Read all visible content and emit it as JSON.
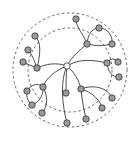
{
  "diagram": {
    "type": "radial-tree",
    "colors": {
      "node_fill": "#9a9a9a",
      "root_fill": "#ffffff",
      "stroke": "#333333",
      "ring": "#555555",
      "background": "#ffffff"
    },
    "rings": [
      {
        "id": "outer",
        "cx": 70,
        "cy": 70,
        "r": 57
      },
      {
        "id": "inner",
        "cx": 70,
        "cy": 70,
        "r": 42
      }
    ],
    "root": {
      "id": "root",
      "x": 67,
      "y": 66,
      "r": 3.2
    },
    "nodes": [
      {
        "id": "n1",
        "x": 76,
        "y": 19
      },
      {
        "id": "n2",
        "x": 99,
        "y": 28
      },
      {
        "id": "n3",
        "x": 87,
        "y": 44
      },
      {
        "id": "n4",
        "x": 112,
        "y": 44
      },
      {
        "id": "n5",
        "x": 35,
        "y": 36
      },
      {
        "id": "n6",
        "x": 28,
        "y": 50
      },
      {
        "id": "n7",
        "x": 23,
        "y": 62
      },
      {
        "id": "n8",
        "x": 37,
        "y": 68
      },
      {
        "id": "n9",
        "x": 107,
        "y": 63
      },
      {
        "id": "n10",
        "x": 118,
        "y": 62
      },
      {
        "id": "n11",
        "x": 119,
        "y": 77
      },
      {
        "id": "n12",
        "x": 43,
        "y": 87
      },
      {
        "id": "n13",
        "x": 27,
        "y": 91
      },
      {
        "id": "n14",
        "x": 32,
        "y": 105
      },
      {
        "id": "n15",
        "x": 42,
        "y": 113
      },
      {
        "id": "n16",
        "x": 66,
        "y": 93
      },
      {
        "id": "n17",
        "x": 81,
        "y": 89
      },
      {
        "id": "n18",
        "x": 112,
        "y": 98
      },
      {
        "id": "n19",
        "x": 102,
        "y": 108
      },
      {
        "id": "n20",
        "x": 86,
        "y": 119
      },
      {
        "id": "n21",
        "x": 67,
        "y": 123
      }
    ],
    "edges": [
      {
        "from": "root",
        "to": "n3",
        "d": "M67,66 C72,56 80,50 87,44"
      },
      {
        "from": "n3",
        "to": "n1",
        "d": "M87,44 C84,34 76,28 76,19"
      },
      {
        "from": "n3",
        "to": "n2",
        "d": "M87,44 C88,34 92,28 99,28"
      },
      {
        "from": "n3",
        "to": "n4",
        "d": "M87,44 C95,46 104,46 112,44"
      },
      {
        "from": "n2",
        "to": "n4",
        "d": "M99,28 C108,28 113,36 112,44"
      },
      {
        "from": "root",
        "to": "n8",
        "d": "M67,66 C56,62 46,64 37,68"
      },
      {
        "from": "n8",
        "to": "n5",
        "d": "M37,68 C40,56 42,42 35,36"
      },
      {
        "from": "n8",
        "to": "n6",
        "d": "M37,68 C34,60 32,54 28,50"
      },
      {
        "from": "n8",
        "to": "n7",
        "d": "M37,68 C32,66 27,64 23,62"
      },
      {
        "from": "root",
        "to": "n9",
        "d": "M67,66 C80,58 94,60 107,63"
      },
      {
        "from": "n9",
        "to": "n10",
        "d": "M107,63 C110,58 115,58 118,62"
      },
      {
        "from": "n9",
        "to": "n11",
        "d": "M107,63 C108,72 112,77 119,77"
      },
      {
        "from": "root",
        "to": "n12",
        "d": "M67,66 C56,70 46,78 43,87"
      },
      {
        "from": "n12",
        "to": "n13",
        "d": "M43,87 C38,82 30,85 27,91"
      },
      {
        "from": "n13",
        "to": "n14",
        "d": "M27,91 C26,97 28,102 32,105"
      },
      {
        "from": "n12",
        "to": "n14",
        "d": "M43,87 C44,96 38,103 32,105"
      },
      {
        "from": "n12",
        "to": "n15",
        "d": "M43,87 C48,96 48,106 42,113"
      },
      {
        "from": "root",
        "to": "n16",
        "d": "M67,66 C66,75 66,84 66,93"
      },
      {
        "from": "root",
        "to": "n21",
        "d": "M67,66 C60,80 62,105 67,123"
      },
      {
        "from": "root",
        "to": "n17",
        "d": "M67,66 C74,72 79,80 81,89"
      },
      {
        "from": "n17",
        "to": "n20",
        "d": "M81,89 C82,100 84,110 86,119"
      },
      {
        "from": "n17",
        "to": "n18",
        "d": "M81,89 C94,84 108,88 112,98"
      },
      {
        "from": "n17",
        "to": "n19",
        "d": "M81,89 C92,92 100,100 102,108"
      }
    ]
  }
}
